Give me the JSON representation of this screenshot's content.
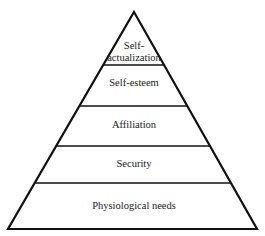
{
  "diagram": {
    "type": "pyramid",
    "line_color": "#111111",
    "background": "#ffffff",
    "levels": [
      {
        "label_line1": "Self-",
        "label_line2": "actualization",
        "rank": 5
      },
      {
        "label": "Self-esteem",
        "rank": 4
      },
      {
        "label": "Affiliation",
        "rank": 3
      },
      {
        "label": "Security",
        "rank": 2
      },
      {
        "label": "Physiological needs",
        "rank": 1
      }
    ]
  }
}
